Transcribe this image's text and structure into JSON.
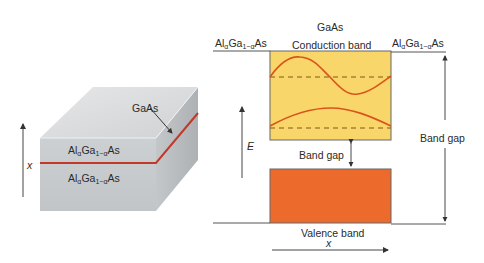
{
  "left_panel": {
    "title": "Heterostructure block",
    "axis_label": "x",
    "layer_top": {
      "prefix": "Al",
      "sub1": "α",
      "mid": "Ga",
      "sub2": "1−α",
      "suffix": "As"
    },
    "layer_bottom": {
      "prefix": "Al",
      "sub1": "α",
      "mid": "Ga",
      "sub2": "1−α",
      "suffix": "As"
    },
    "well_label": "GaAs",
    "colors": {
      "front": "#c9cbcd",
      "top": "#d9dbdd",
      "side": "#b5b8bb",
      "well": "#c0392b"
    }
  },
  "right_panel": {
    "title": "GaAs",
    "left_material": {
      "prefix": "Al",
      "sub1": "α",
      "mid": "Ga",
      "sub2": "1−α",
      "suffix": "As"
    },
    "right_material": {
      "prefix": "Al",
      "sub1": "α",
      "mid": "Ga",
      "sub2": "1−α",
      "suffix": "As"
    },
    "conduction_band_label": "Conduction band",
    "valence_band_label": "Valence band",
    "inner_gap_label": "Band gap",
    "outer_gap_label": "Band gap",
    "energy_axis_label": "E",
    "position_axis_label": "x",
    "colors": {
      "conduction": "#f8d66a",
      "valence": "#ec6a2c",
      "wave": "#d9541c",
      "dash": "#7a5a1a",
      "outline": "#555555"
    }
  }
}
